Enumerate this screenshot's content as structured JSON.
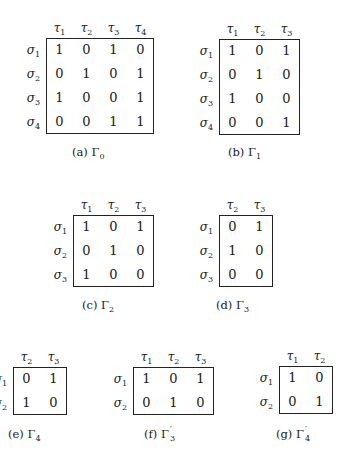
{
  "figures": [
    {
      "id": "a",
      "caption_label": "(a)",
      "caption_symbol": "Γ",
      "caption_sub": "0",
      "caption_prime": "",
      "cols": [
        "1",
        "2",
        "3",
        "4"
      ],
      "rows": [
        "1",
        "2",
        "3",
        "4"
      ],
      "matrix": [
        [
          "1",
          "0",
          "1",
          "0"
        ],
        [
          "0",
          "1",
          "0",
          "1"
        ],
        [
          "1",
          "0",
          "0",
          "1"
        ],
        [
          "0",
          "0",
          "1",
          "1"
        ]
      ]
    },
    {
      "id": "b",
      "caption_label": "(b)",
      "caption_symbol": "Γ",
      "caption_sub": "1",
      "caption_prime": "",
      "cols": [
        "1",
        "2",
        "3"
      ],
      "rows": [
        "1",
        "2",
        "3",
        "4"
      ],
      "matrix": [
        [
          "1",
          "0",
          "1"
        ],
        [
          "0",
          "1",
          "0"
        ],
        [
          "1",
          "0",
          "0"
        ],
        [
          "0",
          "0",
          "1"
        ]
      ]
    },
    {
      "id": "c",
      "caption_label": "(c)",
      "caption_symbol": "Γ",
      "caption_sub": "2",
      "caption_prime": "",
      "cols": [
        "1",
        "2",
        "3"
      ],
      "rows": [
        "1",
        "2",
        "3"
      ],
      "matrix": [
        [
          "1",
          "0",
          "1"
        ],
        [
          "0",
          "1",
          "0"
        ],
        [
          "1",
          "0",
          "0"
        ]
      ]
    },
    {
      "id": "d",
      "caption_label": "(d)",
      "caption_symbol": "Γ",
      "caption_sub": "3",
      "caption_prime": "",
      "cols": [
        "2",
        "3"
      ],
      "rows": [
        "1",
        "2",
        "3"
      ],
      "matrix": [
        [
          "0",
          "1"
        ],
        [
          "1",
          "0"
        ],
        [
          "0",
          "0"
        ]
      ]
    },
    {
      "id": "e",
      "caption_label": "(e)",
      "caption_symbol": "Γ",
      "caption_sub": "4",
      "caption_prime": "",
      "cols": [
        "2",
        "3"
      ],
      "rows": [
        "1",
        "2"
      ],
      "matrix": [
        [
          "0",
          "1"
        ],
        [
          "1",
          "0"
        ]
      ]
    },
    {
      "id": "f",
      "caption_label": "(f)",
      "caption_symbol": "Γ",
      "caption_sub": "3",
      "caption_prime": "′",
      "cols": [
        "1",
        "2",
        "3"
      ],
      "rows": [
        "1",
        "2"
      ],
      "matrix": [
        [
          "1",
          "0",
          "1"
        ],
        [
          "0",
          "1",
          "0"
        ]
      ]
    },
    {
      "id": "g",
      "caption_label": "(g)",
      "caption_symbol": "Γ",
      "caption_sub": "4",
      "caption_prime": "′",
      "cols": [
        "1",
        "2"
      ],
      "rows": [
        "1",
        "2"
      ],
      "matrix": [
        [
          "1",
          "0"
        ],
        [
          "0",
          "1"
        ]
      ]
    }
  ],
  "symbols": {
    "col": "τ",
    "row": "σ"
  }
}
